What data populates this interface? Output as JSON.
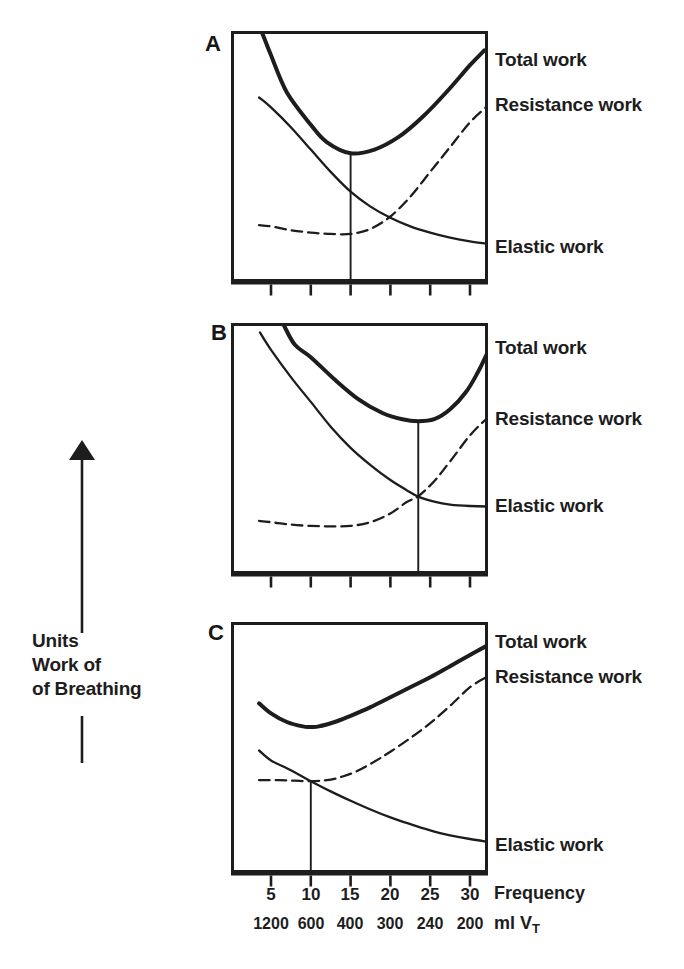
{
  "page": {
    "bg": "#ffffff",
    "ink": "#1d1d1d"
  },
  "y_axis": {
    "lines": [
      "Units",
      "Work of",
      "of Breathing"
    ]
  },
  "x_axis": {
    "tick_labels": [
      "5",
      "10",
      "15",
      "20",
      "25",
      "30"
    ],
    "axis_label": "Frequency",
    "vt_labels": [
      "1200",
      "600",
      "400",
      "300",
      "240",
      "200"
    ],
    "vt_axis_prefix": "ml V",
    "vt_axis_sub": "T"
  },
  "curve_labels": {
    "total": "Total work",
    "resistance": "Resistance work",
    "elastic": "Elastic work"
  },
  "chart_data": {
    "type": "line",
    "xlabel": "Frequency",
    "x2label": "ml VT",
    "ylabel": "Units Work of of Breathing",
    "x_ticks": [
      5,
      10,
      15,
      20,
      25,
      30
    ],
    "x2_ticks": [
      1200,
      600,
      400,
      300,
      240,
      200
    ],
    "ylim": [
      0,
      100
    ],
    "xlim": [
      0.125,
      32.4
    ],
    "grid": false,
    "legend_position": "right-of-curves",
    "panels": [
      {
        "label": "A",
        "optimum_frequency": 15,
        "optimum_line": {
          "x": 15,
          "y_top": 51.5
        },
        "series": [
          {
            "name": "Total work",
            "style": "thick-solid",
            "x": [
              3.9,
              5,
              7,
              10,
              12,
              15,
              18,
              21,
              24,
              27,
              30,
              31.8
            ],
            "y": [
              100,
              91,
              76,
              63,
              56,
              51.5,
              53,
              58,
              66,
              76,
              87,
              93
            ]
          },
          {
            "name": "Resistance work",
            "style": "dashed",
            "x": [
              3.5,
              5,
              7.5,
              10,
              12.5,
              15,
              17.5,
              20,
              22.5,
              25,
              27.5,
              30,
              32
            ],
            "y": [
              22.5,
              22,
              20.5,
              19.5,
              19,
              19,
              21,
              26,
              34,
              44,
              54,
              64,
              70
            ]
          },
          {
            "name": "Elastic work",
            "style": "thin-solid",
            "x": [
              3.5,
              5,
              7.5,
              10,
              12.5,
              15,
              17.5,
              20,
              22.5,
              25,
              27.5,
              30,
              32.2
            ],
            "y": [
              74,
              70,
              62,
              53,
              44,
              36,
              30,
              25.5,
              22,
              19.5,
              17.5,
              16,
              15
            ]
          }
        ]
      },
      {
        "label": "B",
        "optimum_frequency": 23.5,
        "optimum_line": {
          "x": 23.5,
          "y_top": 61.2
        },
        "series": [
          {
            "name": "Total work",
            "style": "thick-solid",
            "x": [
              6.6,
              8,
              10,
              13,
              16,
              19,
              21.5,
              23.5,
              25.5,
              27.5,
              29.5,
              31,
              32.3
            ],
            "y": [
              100,
              92,
              87,
              78,
              70,
              64.5,
              62,
              61.2,
              62,
              66,
              73,
              81,
              89.5
            ]
          },
          {
            "name": "Resistance work",
            "style": "dashed",
            "x": [
              3.5,
              5,
              7.5,
              10,
              12.5,
              15,
              17.5,
              20,
              22,
              23.5,
              25.5,
              27.5,
              30,
              32
            ],
            "y": [
              21,
              20.5,
              19.5,
              19,
              18.8,
              19,
              20.5,
              24,
              28.5,
              31,
              37,
              45,
              55.5,
              62
            ]
          },
          {
            "name": "Elastic work",
            "style": "thin-solid",
            "x": [
              3.6,
              5,
              7.5,
              10,
              12.5,
              15,
              17.5,
              20,
              22,
              23.5,
              25.5,
              27.5,
              30,
              32.3
            ],
            "y": [
              97,
              90,
              79,
              69,
              59,
              50.5,
              43.5,
              37.5,
              33.5,
              30.8,
              28.8,
              27.6,
              27,
              26.8
            ]
          }
        ]
      },
      {
        "label": "C",
        "optimum_frequency": 10,
        "optimum_line": {
          "x": 10,
          "y_top": 36.6
        },
        "series": [
          {
            "name": "Total work",
            "style": "thick-solid",
            "x": [
              3.5,
              5,
              7,
              9,
              10,
              11,
              13,
              15,
              17.5,
              20,
              22.5,
              25,
              27.5,
              30,
              32
            ],
            "y": [
              68,
              64,
              60.5,
              58.7,
              58.5,
              58.7,
              60.5,
              63,
              66.5,
              70.5,
              74.5,
              78.5,
              83,
              87.5,
              91
            ]
          },
          {
            "name": "Resistance work",
            "style": "dashed",
            "x": [
              3.5,
              6,
              8,
              10,
              12,
              14,
              16,
              18,
              20,
              22.5,
              25,
              27.5,
              30,
              32
            ],
            "y": [
              37,
              37,
              36.8,
              36.6,
              37,
              38.5,
              41,
              44.5,
              48.5,
              54,
              60,
              67,
              74.5,
              78.5
            ]
          },
          {
            "name": "Elastic work",
            "style": "thin-solid",
            "x": [
              3.5,
              5,
              7.5,
              10,
              12.5,
              15,
              17.5,
              20,
              22.5,
              25,
              27.5,
              30,
              32
            ],
            "y": [
              49,
              45,
              41,
              36.6,
              32.5,
              28.7,
              25.2,
              22,
              19.3,
              16.8,
              14.8,
              13.3,
              12.3
            ]
          }
        ]
      }
    ]
  }
}
